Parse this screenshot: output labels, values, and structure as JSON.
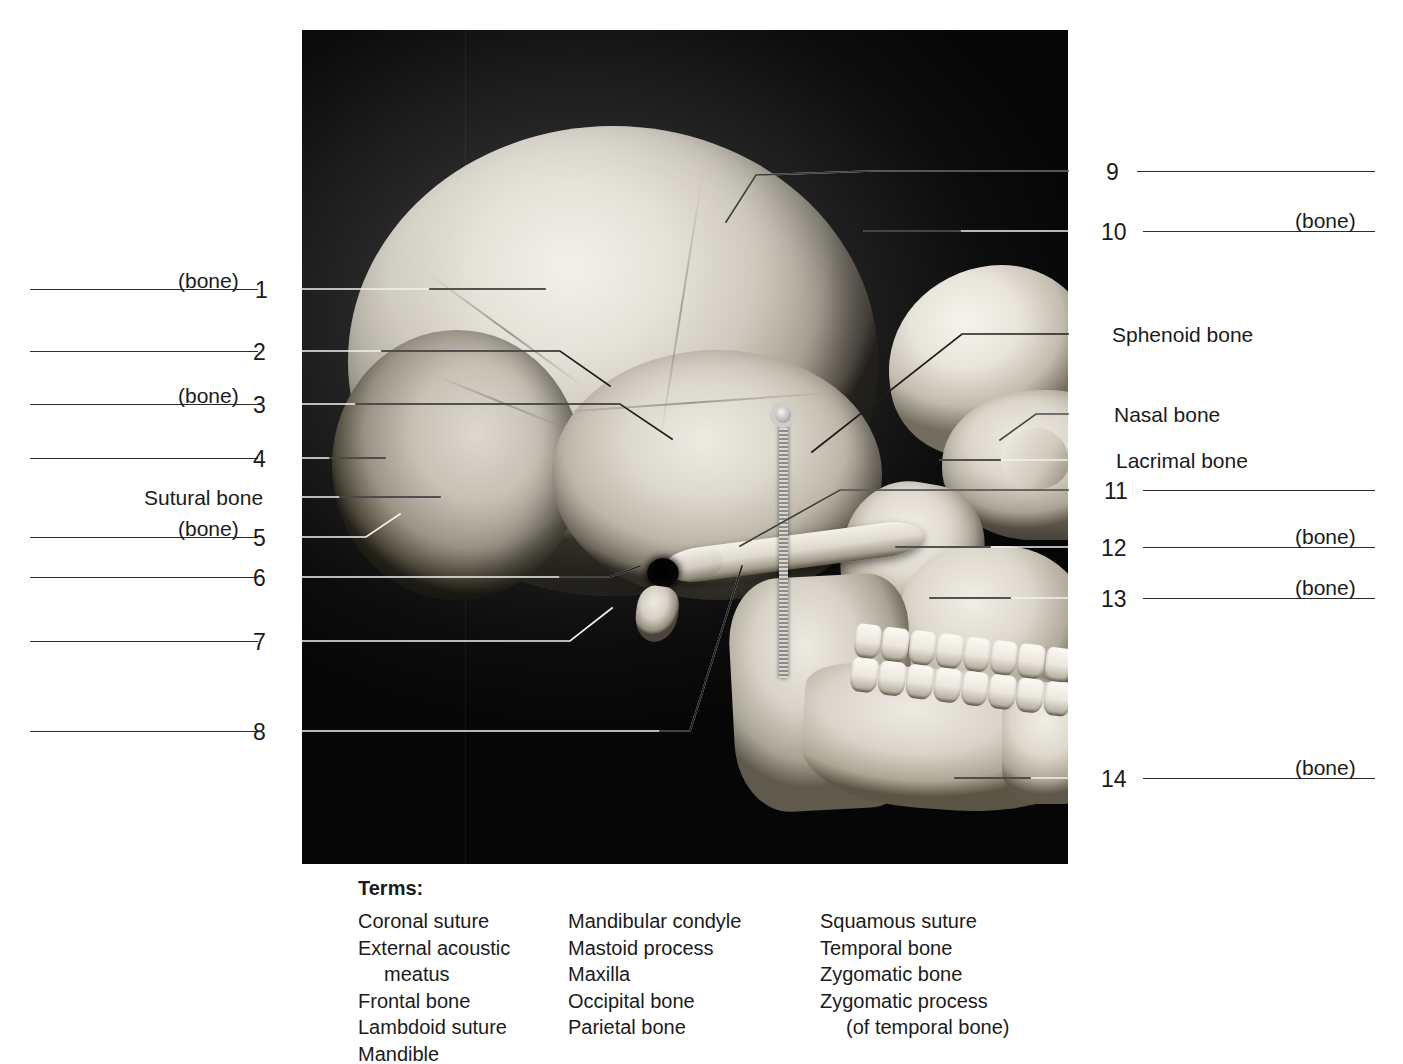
{
  "figure": {
    "kind": "lateral-skull-photograph",
    "caption_terms_header": "Terms:"
  },
  "left_labels": [
    {
      "id": "1",
      "number": "1",
      "bone_suffix": "(bone)",
      "has_blank": true,
      "name": ""
    },
    {
      "id": "2",
      "number": "2",
      "bone_suffix": "",
      "has_blank": true,
      "name": ""
    },
    {
      "id": "3",
      "number": "3",
      "bone_suffix": "(bone)",
      "has_blank": true,
      "name": ""
    },
    {
      "id": "4",
      "number": "4",
      "bone_suffix": "",
      "has_blank": true,
      "name": ""
    },
    {
      "id": "sutural",
      "number": "",
      "bone_suffix": "",
      "has_blank": false,
      "name": "Sutural bone"
    },
    {
      "id": "5",
      "number": "5",
      "bone_suffix": "(bone)",
      "has_blank": true,
      "name": ""
    },
    {
      "id": "6",
      "number": "6",
      "bone_suffix": "",
      "has_blank": true,
      "name": ""
    },
    {
      "id": "7",
      "number": "7",
      "bone_suffix": "",
      "has_blank": true,
      "name": ""
    },
    {
      "id": "8",
      "number": "8",
      "bone_suffix": "",
      "has_blank": true,
      "name": ""
    }
  ],
  "right_labels": [
    {
      "id": "9",
      "number": "9",
      "bone_suffix": "",
      "has_blank": true,
      "name": ""
    },
    {
      "id": "10",
      "number": "10",
      "bone_suffix": "(bone)",
      "has_blank": true,
      "name": ""
    },
    {
      "id": "sphenoid",
      "number": "",
      "bone_suffix": "",
      "has_blank": false,
      "name": "Sphenoid bone"
    },
    {
      "id": "nasal",
      "number": "",
      "bone_suffix": "",
      "has_blank": false,
      "name": "Nasal bone"
    },
    {
      "id": "lacrimal",
      "number": "",
      "bone_suffix": "",
      "has_blank": false,
      "name": "Lacrimal bone"
    },
    {
      "id": "11",
      "number": "11",
      "bone_suffix": "",
      "has_blank": true,
      "name": ""
    },
    {
      "id": "12",
      "number": "12",
      "bone_suffix": "(bone)",
      "has_blank": true,
      "name": ""
    },
    {
      "id": "13",
      "number": "13",
      "bone_suffix": "(bone)",
      "has_blank": true,
      "name": ""
    },
    {
      "id": "14",
      "number": "14",
      "bone_suffix": "(bone)",
      "has_blank": true,
      "name": ""
    }
  ],
  "terms": {
    "header": "Terms:",
    "columns": [
      [
        "Coronal suture",
        "External acoustic",
        "meatus",
        "Frontal bone",
        "Lambdoid suture",
        "Mandible"
      ],
      [
        "Mandibular condyle",
        "Mastoid process",
        "Maxilla",
        "Occipital bone",
        "Parietal bone"
      ],
      [
        "Squamous suture",
        "Temporal bone",
        "Zygomatic bone",
        "Zygomatic process",
        "(of temporal bone)"
      ]
    ],
    "indented": [
      [
        2
      ],
      [],
      [
        4
      ]
    ]
  },
  "colors": {
    "ink": "#1b1b1b",
    "rule": "#2b2b2b",
    "leader_dark": "#1e1e1e",
    "leader_light": "#f2f2f2",
    "plate_bg": "#0a0a0a"
  }
}
